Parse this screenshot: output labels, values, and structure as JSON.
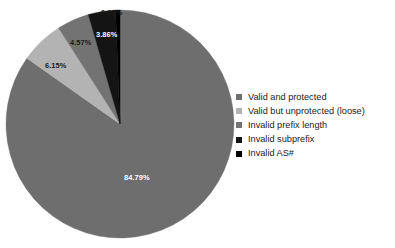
{
  "chart_data": {
    "type": "pie",
    "title": "",
    "legend_position": "right",
    "background": "#ffffff",
    "start_angle_deg": 0,
    "direction": "clockwise",
    "categories": [
      "Valid and protected",
      "Valid but unprotected (loose)",
      "Invalid prefix length",
      "Invalid subprefix",
      "Invalid AS#"
    ],
    "values": [
      84.79,
      6.15,
      4.57,
      3.86,
      0.63
    ],
    "value_labels": [
      "84.79%",
      "6.15%",
      "4.57%",
      "3.86%",
      "0.63%"
    ],
    "colors": [
      "#6e6e6e",
      "#b3b3b3",
      "#737373",
      "#141414",
      "#000000"
    ],
    "slices": [
      {
        "label": "Valid and protected",
        "value": 84.79,
        "value_label": "84.79%",
        "color": "#6e6e6e",
        "label_placement": "inside",
        "label_color": "#ffffff"
      },
      {
        "label": "Valid but unprotected (loose)",
        "value": 6.15,
        "value_label": "6.15%",
        "color": "#b3b3b3",
        "label_placement": "inside",
        "label_color": "#1a1a1a"
      },
      {
        "label": "Invalid prefix length",
        "value": 4.57,
        "value_label": "4.57%",
        "color": "#737373",
        "label_placement": "inside",
        "label_color": "#1a1a1a"
      },
      {
        "label": "Invalid subprefix",
        "value": 3.86,
        "value_label": "3.86%",
        "color": "#141414",
        "label_placement": "inside",
        "label_color": "#ffffff"
      },
      {
        "label": "Invalid AS#",
        "value": 0.63,
        "value_label": "0.63%",
        "color": "#000000",
        "label_placement": "outside",
        "label_color": "#1a1a1a"
      }
    ]
  },
  "legend": {
    "items": [
      {
        "label": "Valid and protected",
        "color": "#6e6e6e"
      },
      {
        "label": "Valid but unprotected (loose)",
        "color": "#b3b3b3"
      },
      {
        "label": "Invalid prefix length",
        "color": "#737373"
      },
      {
        "label": "Invalid subprefix",
        "color": "#141414"
      },
      {
        "label": "Invalid AS#",
        "color": "#000000"
      }
    ]
  },
  "labels": {
    "top": "0.63%",
    "dark": "3.86%",
    "mid": "4.57%",
    "light": "6.15%",
    "main": "84.79%"
  }
}
